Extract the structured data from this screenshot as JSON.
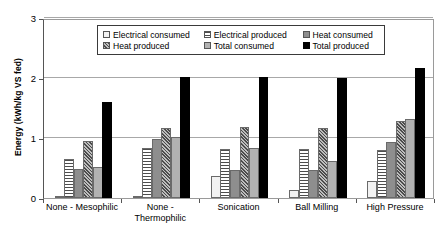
{
  "chart_data": {
    "type": "bar",
    "title": "",
    "xlabel": "",
    "ylabel": "Energy (kWh/kg VS fed)",
    "ylim": [
      0,
      3
    ],
    "yticks": [
      0,
      1,
      2,
      3
    ],
    "ytick_labels": [
      "0",
      "1",
      "2",
      "3"
    ],
    "grid": true,
    "legend_position": "top-center",
    "categories": [
      "None - Mesophilic",
      "None - \nThermophilic",
      "Sonication",
      "Ball Milling",
      "High Pressure"
    ],
    "series": [
      {
        "name": "Electrical consumed",
        "pattern": "electrical-consumed",
        "color": "#f2f2f2",
        "values": [
          0.03,
          0.02,
          0.36,
          0.13,
          0.28
        ]
      },
      {
        "name": "Electrical produced",
        "pattern": "electrical-produced",
        "color": "#4d4d4d",
        "values": [
          0.65,
          0.83,
          0.82,
          0.82,
          0.8
        ]
      },
      {
        "name": "Heat consumed",
        "pattern": "heat-consumed",
        "color": "#8e8e8e",
        "values": [
          0.48,
          0.98,
          0.47,
          0.47,
          0.93
        ]
      },
      {
        "name": "Heat produced",
        "pattern": "heat-produced",
        "color": "#bdbdbd",
        "values": [
          0.95,
          1.17,
          1.19,
          1.17,
          1.28
        ]
      },
      {
        "name": "Total consumed",
        "pattern": "total-consumed",
        "color": "#b2b2b2",
        "values": [
          0.52,
          1.02,
          0.84,
          0.62,
          1.32
        ]
      },
      {
        "name": "Total produced",
        "pattern": "total-produced",
        "color": "#000000",
        "values": [
          1.6,
          2.02,
          2.02,
          2.0,
          2.17
        ]
      }
    ]
  },
  "legend": {
    "rows": [
      [
        "Electrical consumed",
        "Electrical produced",
        "Heat consumed"
      ],
      [
        "Heat produced",
        "Total consumed",
        "Total produced"
      ]
    ]
  }
}
